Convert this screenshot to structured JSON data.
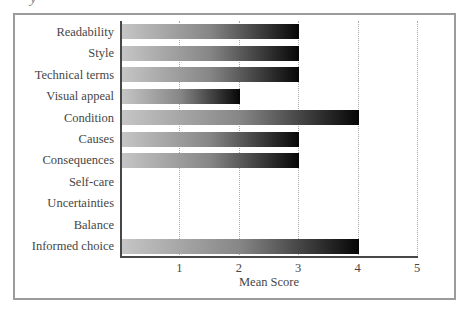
{
  "page": {
    "cropped_text_fragment": "y"
  },
  "chart_data": {
    "type": "bar",
    "orientation": "horizontal",
    "title": "",
    "xlabel": "Mean Score",
    "ylabel": "",
    "categories": [
      "Readability",
      "Style",
      "Technical terms",
      "Visual appeal",
      "Condition",
      "Causes",
      "Consequences",
      "Self-care",
      "Uncertainties",
      "Balance",
      "Informed choice"
    ],
    "values": [
      3,
      3,
      3,
      2,
      4,
      3,
      3,
      0,
      0,
      0,
      4
    ],
    "xlim": [
      0,
      5
    ],
    "xticks": [
      1,
      2,
      3,
      4,
      5
    ],
    "grid": "vertical-dotted",
    "legend": "none",
    "bar_gradient_start": "#c6c6c6",
    "bar_gradient_mid": "#868686",
    "bar_gradient_end": "#060606",
    "axis_color": "#474747",
    "gridline_color": "#a9a9a9",
    "text_color": "#464646",
    "frame_border_color": "#9b9b9b"
  }
}
